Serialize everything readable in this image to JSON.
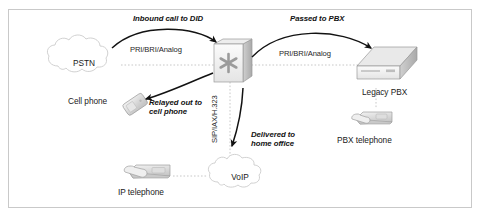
{
  "figure": {
    "background": "#ffffff",
    "border_color": "#c9c9c9"
  },
  "nodes": [
    {
      "id": "pstn",
      "label": "PSTN",
      "type": "cloud",
      "x": 84,
      "y": 62
    },
    {
      "id": "asterisk",
      "label": "",
      "type": "server",
      "x": 231,
      "y": 62
    },
    {
      "id": "cell-phone",
      "label": "Cell phone",
      "type": "mobile",
      "x": 92,
      "y": 101
    },
    {
      "id": "legacy-pbx",
      "label": "Legacy PBX",
      "type": "pbx",
      "x": 388,
      "y": 62
    },
    {
      "id": "pbx-telephone",
      "label": "PBX telephone",
      "type": "desk-phone",
      "x": 372,
      "y": 122
    },
    {
      "id": "ip-telephone",
      "label": "IP telephone",
      "type": "desk-phone",
      "x": 147,
      "y": 176
    },
    {
      "id": "voip",
      "label": "VoIP",
      "type": "cloud",
      "x": 240,
      "y": 178
    }
  ],
  "link_labels": [
    {
      "id": "pstn-asterisk",
      "text": "PRI/BRI/Analog"
    },
    {
      "id": "asterisk-pbx",
      "text": "PRI/BRI/Analog"
    },
    {
      "id": "asterisk-voip",
      "text": "SIP/IAX/H.323"
    }
  ],
  "flow_labels": [
    {
      "id": "inbound",
      "line1": "Inbound call to DID",
      "line2": ""
    },
    {
      "id": "passed",
      "line1": "Passed to PBX",
      "line2": ""
    },
    {
      "id": "relayed",
      "line1": "Relayed out to",
      "line2": "cell phone"
    },
    {
      "id": "delivered",
      "line1": "Delivered to",
      "line2": "home office"
    }
  ],
  "icons": {
    "asterisk_glyph": "asterisk-icon",
    "cloud_glyph": "cloud-icon",
    "server_glyph": "server-box-icon",
    "pbx_glyph": "pbx-appliance-icon",
    "deskphone_glyph": "desk-phone-icon",
    "mobile_glyph": "mobile-phone-icon",
    "arrow_glyph": "curved-arrow-icon"
  },
  "colors": {
    "line": "#bdbdbd",
    "arrow": "#1a1a1a",
    "device_light": "#f2f2f2",
    "device_mid": "#d8d8d8",
    "device_dark": "#b4b4b4",
    "text": "#1a1a1a"
  }
}
